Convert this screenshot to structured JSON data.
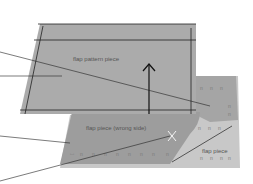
{
  "diagram": {
    "labels": {
      "pattern_piece": "flap pattern piece",
      "wrong_side": "flap piece (wrong side)",
      "flap_piece": "flap piece"
    },
    "colors": {
      "background": "#ffffff",
      "pattern_piece": "#ababab",
      "wrong_side": "#9d9d9d",
      "right_side": "#c8c8c8",
      "back_flap": "#a5a5a5",
      "lines": "#222222",
      "pin_mark": "#f5f5f5"
    },
    "leader_lines": 4
  }
}
